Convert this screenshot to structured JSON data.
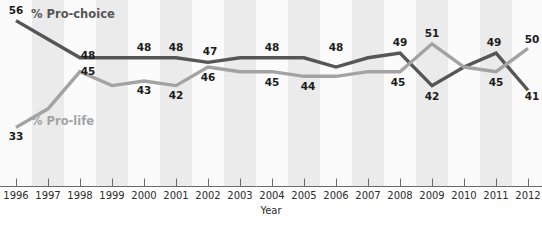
{
  "chart_data": {
    "type": "line",
    "title": "",
    "subtitle": "",
    "xlabel": "Year",
    "ylabel": "",
    "grid": false,
    "legend_position": "inline-annotation",
    "x": [
      1996,
      1997,
      1998,
      1999,
      2000,
      2001,
      2002,
      2003,
      2004,
      2005,
      2006,
      2007,
      2008,
      2009,
      2010,
      2011,
      2012
    ],
    "categories": [
      "1996",
      "1997",
      "1998",
      "1999",
      "2000",
      "2001",
      "2002",
      "2003",
      "2004",
      "2005",
      "2006",
      "2007",
      "2008",
      "2009",
      "2010",
      "2011",
      "2012"
    ],
    "xlim": [
      1996,
      2012
    ],
    "ylim": [
      32,
      57
    ],
    "series": [
      {
        "name": "% Pro-choice",
        "color": "#565656",
        "stroke_width": 3.4,
        "values": [
          56,
          52,
          48,
          48,
          48,
          48,
          47,
          48,
          48,
          48,
          46,
          48,
          49,
          42,
          46,
          49,
          41
        ],
        "point_labels": [
          {
            "x": 1996,
            "value": 56,
            "text": "56",
            "dx": 0,
            "dy": -7,
            "anchor": "start"
          },
          {
            "x": 1998,
            "value": 48,
            "text": "48",
            "dx": 8,
            "dy": 1,
            "anchor": "start"
          },
          {
            "x": 2000,
            "value": 48,
            "text": "48",
            "dx": 0,
            "dy": -7,
            "anchor": "middle"
          },
          {
            "x": 2001,
            "value": 48,
            "text": "48",
            "dx": 0,
            "dy": -7,
            "anchor": "middle"
          },
          {
            "x": 2002,
            "value": 47,
            "text": "47",
            "dx": 2,
            "dy": -7,
            "anchor": "middle"
          },
          {
            "x": 2004,
            "value": 48,
            "text": "48",
            "dx": 0,
            "dy": -7,
            "anchor": "middle"
          },
          {
            "x": 2006,
            "value": 48,
            "text": "48",
            "dx": 0,
            "dy": -7,
            "anchor": "middle"
          },
          {
            "x": 2008,
            "value": 49,
            "text": "49",
            "dx": 0,
            "dy": -7,
            "anchor": "middle"
          },
          {
            "x": 2009,
            "value": 42,
            "text": "42",
            "dx": 0,
            "dy": 14,
            "anchor": "middle"
          },
          {
            "x": 2011,
            "value": 49,
            "text": "49",
            "dx": -2,
            "dy": -7,
            "anchor": "middle"
          },
          {
            "x": 2012,
            "value": 41,
            "text": "41",
            "dx": 4,
            "dy": 10,
            "anchor": "start"
          }
        ]
      },
      {
        "name": "% Pro-life",
        "color": "#a3a3a3",
        "stroke_width": 3.4,
        "values": [
          33,
          37,
          45,
          42,
          43,
          42,
          46,
          45,
          45,
          44,
          44,
          45,
          45,
          51,
          46,
          45,
          50
        ],
        "point_labels": [
          {
            "x": 1996,
            "value": 33,
            "text": "33",
            "dx": 0,
            "dy": 13,
            "anchor": "start"
          },
          {
            "x": 1998,
            "value": 45,
            "text": "45",
            "dx": 8,
            "dy": 3,
            "anchor": "start"
          },
          {
            "x": 2000,
            "value": 43,
            "text": "43",
            "dx": 0,
            "dy": 13,
            "anchor": "middle"
          },
          {
            "x": 2001,
            "value": 42,
            "text": "42",
            "dx": 0,
            "dy": 13,
            "anchor": "middle"
          },
          {
            "x": 2002,
            "value": 46,
            "text": "46",
            "dx": 0,
            "dy": 14,
            "anchor": "middle"
          },
          {
            "x": 2004,
            "value": 45,
            "text": "45",
            "dx": 0,
            "dy": 14,
            "anchor": "middle"
          },
          {
            "x": 2005,
            "value": 44,
            "text": "44",
            "dx": 4,
            "dy": 14,
            "anchor": "middle"
          },
          {
            "x": 2008,
            "value": 45,
            "text": "45",
            "dx": -2,
            "dy": 14,
            "anchor": "middle"
          },
          {
            "x": 2009,
            "value": 51,
            "text": "51",
            "dx": 0,
            "dy": -7,
            "anchor": "middle"
          },
          {
            "x": 2011,
            "value": 45,
            "text": "45",
            "dx": 0,
            "dy": 14,
            "anchor": "middle"
          },
          {
            "x": 2012,
            "value": 50,
            "text": "50",
            "dx": 4,
            "dy": -5,
            "anchor": "start"
          }
        ]
      }
    ],
    "series_annotations": [
      {
        "name": "% Pro-choice",
        "text": "% Pro-choice",
        "color": "#565656",
        "x_px": 31,
        "y_px": 18
      },
      {
        "name": "% Pro-life",
        "text": "% Pro-life",
        "color": "#a3a3a3",
        "x_px": 31,
        "y_px": 125
      }
    ]
  },
  "axis": {
    "x_title": "Year",
    "tick_labels": [
      "1996",
      "1997",
      "1998",
      "1999",
      "2000",
      "2001",
      "2002",
      "2003",
      "2004",
      "2005",
      "2006",
      "2007",
      "2008",
      "2009",
      "2010",
      "2011",
      "2012"
    ]
  },
  "colors": {
    "pro_choice": "#565656",
    "pro_life": "#a3a3a3",
    "band": "#ebebeb",
    "band_alt": "#fbfbfb",
    "axis": "#6b6b6b",
    "text": "#2b2b2b",
    "background": "#ffffff"
  }
}
